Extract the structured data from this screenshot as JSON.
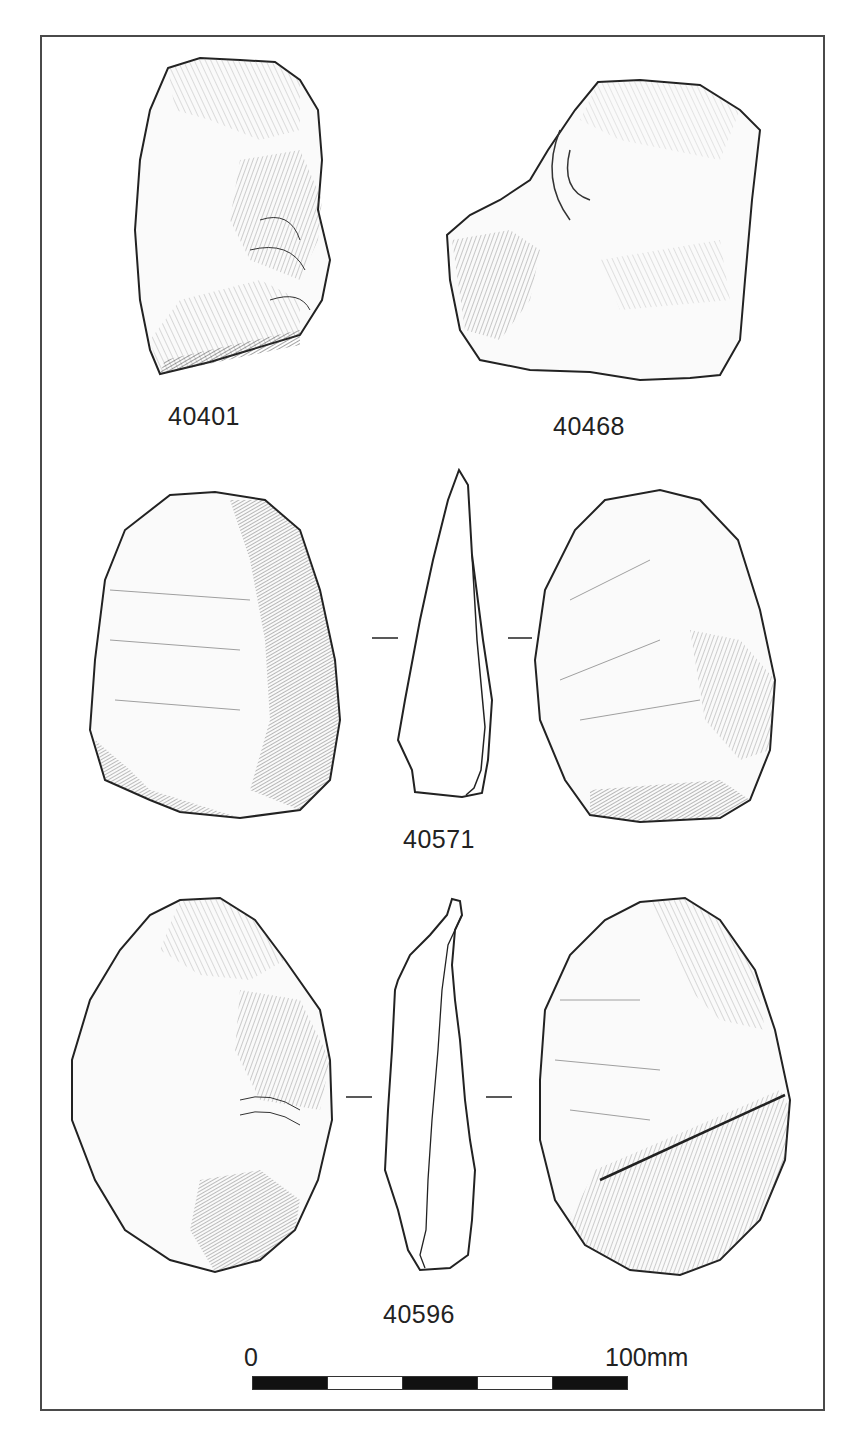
{
  "plate": {
    "artifacts": [
      {
        "id": "40401",
        "label": "40401",
        "views": [
          "face"
        ]
      },
      {
        "id": "40468",
        "label": "40468",
        "views": [
          "face"
        ]
      },
      {
        "id": "40571",
        "label": "40571",
        "views": [
          "face-a",
          "section",
          "face-b"
        ]
      },
      {
        "id": "40596",
        "label": "40596",
        "views": [
          "face-a",
          "section",
          "face-b"
        ]
      }
    ],
    "scale_bar": {
      "start_label": "0",
      "end_label": "100mm",
      "segments": [
        "black",
        "white",
        "black",
        "white",
        "black"
      ]
    }
  },
  "colors": {
    "ink": "#222222",
    "frame": "#4a4a4a",
    "paper": "#ffffff"
  }
}
